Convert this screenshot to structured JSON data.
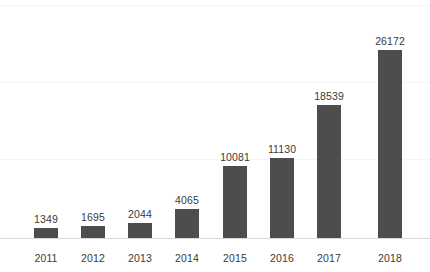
{
  "chart_data": {
    "type": "bar",
    "title": "",
    "subtitle": "",
    "xlabel": "",
    "ylabel": "",
    "categories": [
      "2011",
      "2012",
      "2013",
      "2014",
      "2015",
      "2016",
      "2017",
      "2018"
    ],
    "values": [
      1349,
      1695,
      2044,
      4065,
      10081,
      11130,
      18539,
      26172
    ],
    "value_labels": [
      "1349",
      "1695",
      "2044",
      "4065",
      "10081",
      "11130",
      "18539",
      "26172"
    ],
    "series": [
      {
        "name": "",
        "values": [
          1349,
          1695,
          2044,
          4065,
          10081,
          11130,
          18539,
          26172
        ]
      }
    ],
    "ylim": [
      0,
      32450
    ],
    "gridlines": [
      10860,
      21720,
      32450
    ],
    "grid": true,
    "grid_axis": "y",
    "legend": false,
    "legend_position": "none",
    "y_axis_visible": false,
    "y_tick_labels": [],
    "x_tick_labels": [
      "2011",
      "2012",
      "2013",
      "2014",
      "2015",
      "2016",
      "2017",
      "2018"
    ],
    "data_labels_shown": true,
    "bar_color": "#4d4d4d",
    "grid_color": "#f4f4f4",
    "axis_color": "#d9d9d9",
    "label_color": "#3a3a3a",
    "background_color": "#ffffff"
  }
}
